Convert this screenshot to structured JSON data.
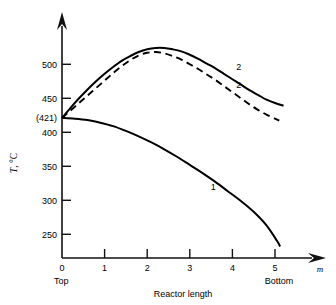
{
  "chart_data": {
    "type": "line",
    "title": "",
    "xlabel": "Reactor length",
    "ylabel": "T, °C",
    "x_unit": "m",
    "xlim": [
      0,
      5.8
    ],
    "ylim": [
      225,
      540
    ],
    "grid": false,
    "legend": "inline-curve-labels",
    "x_ticks": [
      {
        "value": 0,
        "label": "0"
      },
      {
        "value": 1,
        "label": "1"
      },
      {
        "value": 2,
        "label": "2"
      },
      {
        "value": 3,
        "label": "3"
      },
      {
        "value": 4,
        "label": "4"
      },
      {
        "value": 5,
        "label": "5"
      }
    ],
    "y_ticks": [
      {
        "value": 500,
        "label": "500"
      },
      {
        "value": 450,
        "label": "450"
      },
      {
        "value": 421,
        "label": "(421)"
      },
      {
        "value": 400,
        "label": "400"
      },
      {
        "value": 350,
        "label": "350"
      },
      {
        "value": 300,
        "label": "300"
      },
      {
        "value": 250,
        "label": "250"
      }
    ],
    "annotations": [
      {
        "name": "top-annotation",
        "text": "Top",
        "x": 0
      },
      {
        "name": "bottom-annotation",
        "text": "Bottom",
        "x": 5
      },
      {
        "name": "inlet-temperature",
        "text": "(421)",
        "y": 421
      }
    ],
    "series": [
      {
        "name": "curve-2-solid",
        "label": "2",
        "style": "solid",
        "color": "#000000",
        "label_x": 4.15,
        "label_y": 492,
        "points": [
          [
            0.0,
            421
          ],
          [
            0.2,
            436
          ],
          [
            0.4,
            450
          ],
          [
            0.6,
            463
          ],
          [
            0.8,
            475
          ],
          [
            1.0,
            486
          ],
          [
            1.2,
            496
          ],
          [
            1.4,
            505
          ],
          [
            1.6,
            512
          ],
          [
            1.8,
            518
          ],
          [
            2.0,
            522
          ],
          [
            2.2,
            524
          ],
          [
            2.4,
            524
          ],
          [
            2.6,
            522
          ],
          [
            2.8,
            519
          ],
          [
            3.0,
            514
          ],
          [
            3.2,
            508
          ],
          [
            3.4,
            501
          ],
          [
            3.6,
            494
          ],
          [
            3.8,
            486
          ],
          [
            4.0,
            478
          ],
          [
            4.2,
            470
          ],
          [
            4.4,
            462
          ],
          [
            4.6,
            455
          ],
          [
            4.8,
            448
          ],
          [
            5.0,
            443
          ],
          [
            5.2,
            439
          ]
        ]
      },
      {
        "name": "curve-2-dashed",
        "label": "2",
        "style": "dashed",
        "color": "#000000",
        "label_x": 4.15,
        "label_y": 465,
        "points": [
          [
            0.0,
            421
          ],
          [
            0.2,
            432
          ],
          [
            0.4,
            443
          ],
          [
            0.6,
            454
          ],
          [
            0.8,
            465
          ],
          [
            1.0,
            476
          ],
          [
            1.2,
            487
          ],
          [
            1.4,
            497
          ],
          [
            1.6,
            506
          ],
          [
            1.8,
            513
          ],
          [
            2.0,
            517
          ],
          [
            2.2,
            518
          ],
          [
            2.4,
            516
          ],
          [
            2.6,
            512
          ],
          [
            2.8,
            507
          ],
          [
            3.0,
            500
          ],
          [
            3.2,
            493
          ],
          [
            3.4,
            485
          ],
          [
            3.6,
            477
          ],
          [
            3.8,
            468
          ],
          [
            4.0,
            459
          ],
          [
            4.2,
            450
          ],
          [
            4.4,
            441
          ],
          [
            4.6,
            433
          ],
          [
            4.8,
            426
          ],
          [
            5.0,
            420
          ],
          [
            5.1,
            417
          ]
        ]
      },
      {
        "name": "curve-1",
        "label": "1",
        "style": "solid",
        "color": "#000000",
        "label_x": 3.55,
        "label_y": 315,
        "points": [
          [
            0.0,
            421
          ],
          [
            0.3,
            420
          ],
          [
            0.6,
            418
          ],
          [
            0.9,
            414
          ],
          [
            1.2,
            409
          ],
          [
            1.5,
            402
          ],
          [
            1.8,
            394
          ],
          [
            2.1,
            385
          ],
          [
            2.4,
            375
          ],
          [
            2.7,
            364
          ],
          [
            3.0,
            352
          ],
          [
            3.3,
            340
          ],
          [
            3.6,
            327
          ],
          [
            3.9,
            313
          ],
          [
            4.2,
            299
          ],
          [
            4.5,
            283
          ],
          [
            4.8,
            263
          ],
          [
            5.05,
            240
          ],
          [
            5.12,
            232
          ]
        ]
      }
    ]
  }
}
